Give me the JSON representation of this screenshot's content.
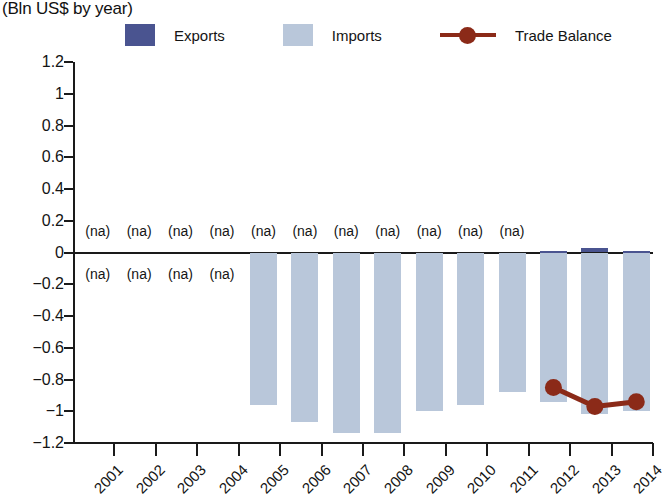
{
  "subtitle": "(Bln US$ by year)",
  "legend": {
    "items": [
      {
        "label": "Exports",
        "type": "swatch",
        "color": "#4a5490",
        "name": "legend-exports"
      },
      {
        "label": "Imports",
        "type": "swatch",
        "color": "#b9c7da",
        "name": "legend-imports"
      },
      {
        "label": "Trade Balance",
        "type": "line",
        "color": "#8b2a18",
        "name": "legend-trade-balance"
      }
    ]
  },
  "axes": {
    "y_ticks": [
      "1.2",
      "1",
      "0.8",
      "0.6",
      "0.4",
      "0.2",
      "0",
      "−0.2",
      "−0.4",
      "−0.6",
      "−0.8",
      "−1",
      "−1.2"
    ],
    "x_ticks": [
      "2001",
      "2002",
      "2003",
      "2004",
      "2005",
      "2006",
      "2007",
      "2008",
      "2009",
      "2010",
      "2011",
      "2012",
      "2013",
      "2014"
    ]
  },
  "na_text": "(na)",
  "chart_data": {
    "type": "bar",
    "title": "",
    "subtitle": "(Bln US$ by year)",
    "xlabel": "",
    "ylabel": "",
    "ylim": [
      -1.2,
      1.2
    ],
    "ytick_step": 0.2,
    "grid": false,
    "legend_position": "top",
    "categories": [
      "2001",
      "2002",
      "2003",
      "2004",
      "2005",
      "2006",
      "2007",
      "2008",
      "2009",
      "2010",
      "2011",
      "2012",
      "2013",
      "2014"
    ],
    "series": [
      {
        "name": "Exports",
        "type": "bar",
        "color": "#4a5490",
        "values": [
          null,
          null,
          null,
          null,
          null,
          null,
          null,
          null,
          null,
          null,
          null,
          0.01,
          0.03,
          0.01
        ],
        "na_labels": [
          "(na)",
          "(na)",
          "(na)",
          "(na)",
          "(na)",
          "(na)",
          "(na)",
          "(na)",
          "(na)",
          "(na)",
          "(na)",
          "",
          "",
          ""
        ]
      },
      {
        "name": "Imports",
        "type": "bar",
        "color": "#b9c7da",
        "values": [
          null,
          null,
          null,
          null,
          -0.96,
          -1.07,
          -1.14,
          -1.14,
          -1.0,
          -0.96,
          -0.88,
          -0.94,
          -1.02,
          -1.0
        ],
        "na_labels": [
          "(na)",
          "(na)",
          "(na)",
          "(na)",
          "",
          "",
          "",
          "",
          "",
          "",
          "",
          "",
          "",
          ""
        ]
      },
      {
        "name": "Trade Balance",
        "type": "line",
        "color": "#8b2a18",
        "values": [
          null,
          null,
          null,
          null,
          null,
          null,
          null,
          null,
          null,
          null,
          null,
          -0.85,
          -0.97,
          -0.94
        ]
      }
    ]
  }
}
